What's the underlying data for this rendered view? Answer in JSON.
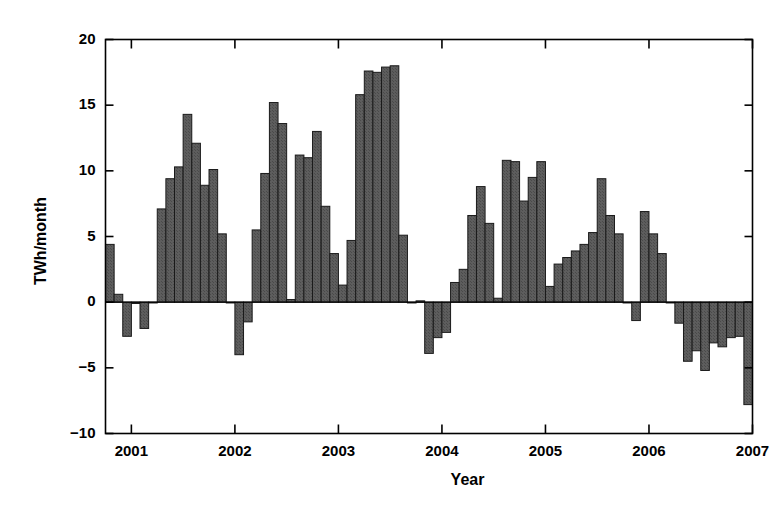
{
  "chart_data": {
    "type": "bar",
    "title": "",
    "xlabel": "Year",
    "ylabel": "TWh/month",
    "ylim": [
      -10,
      20
    ],
    "xlim": [
      2000.75,
      2007.0
    ],
    "yticks": [
      -10,
      -5,
      0,
      5,
      10,
      15,
      20
    ],
    "ytick_labels": [
      "−10",
      "−5",
      "0",
      "5",
      "10",
      "15",
      "20"
    ],
    "xticks": [
      2001,
      2002,
      2003,
      2004,
      2005,
      2006,
      2007
    ],
    "xtick_labels": [
      "2001",
      "2002",
      "2003",
      "2004",
      "2005",
      "2006",
      "2007"
    ],
    "grid": false,
    "legend": null,
    "bar_color": "#595959",
    "bar_edge_color": "#1a1a1a",
    "axes_color": "#000000",
    "background": "#ffffff",
    "bar_width_months": 1,
    "x_start": 2000.75,
    "categories": [
      "2000-10",
      "2000-11",
      "2000-12",
      "2001-01",
      "2001-02",
      "2001-03",
      "2001-04",
      "2001-05",
      "2001-06",
      "2001-07",
      "2001-08",
      "2001-09",
      "2001-10",
      "2001-11",
      "2001-12",
      "2002-01",
      "2002-02",
      "2002-03",
      "2002-04",
      "2002-05",
      "2002-06",
      "2002-07",
      "2002-08",
      "2002-09",
      "2002-10",
      "2002-11",
      "2002-12",
      "2003-01",
      "2003-02",
      "2003-03",
      "2003-04",
      "2003-05",
      "2003-06",
      "2003-07",
      "2003-08",
      "2003-09",
      "2003-10",
      "2003-11",
      "2003-12",
      "2004-01",
      "2004-02",
      "2004-03",
      "2004-04",
      "2004-05",
      "2004-06",
      "2004-07",
      "2004-08",
      "2004-09",
      "2004-10",
      "2004-11",
      "2004-12",
      "2005-01",
      "2005-02",
      "2005-03",
      "2005-04",
      "2005-05",
      "2005-06",
      "2005-07",
      "2005-08",
      "2005-09",
      "2005-10",
      "2005-11",
      "2005-12",
      "2006-01",
      "2006-02",
      "2006-03",
      "2006-04",
      "2006-05",
      "2006-06",
      "2006-07",
      "2006-08",
      "2006-09",
      "2006-10",
      "2006-11",
      "2006-12"
    ],
    "values": [
      4.4,
      0.6,
      -2.6,
      -0.1,
      -2.0,
      0.0,
      7.1,
      9.4,
      10.3,
      14.3,
      12.1,
      8.9,
      10.1,
      5.2,
      0.0,
      -4.0,
      -1.5,
      5.5,
      9.8,
      15.2,
      13.6,
      0.2,
      11.2,
      11.0,
      13.0,
      7.3,
      3.7,
      1.3,
      4.7,
      15.8,
      17.6,
      17.5,
      17.9,
      18.0,
      5.1,
      0.0,
      0.1,
      -3.9,
      -2.7,
      -2.3,
      1.5,
      2.5,
      6.6,
      8.8,
      6.0,
      0.3,
      10.8,
      10.7,
      7.7,
      9.5,
      10.7,
      1.2,
      2.9,
      3.4,
      3.9,
      4.4,
      5.3,
      9.4,
      6.6,
      5.2,
      0.0,
      -1.4,
      6.9,
      5.2,
      3.7,
      0.0,
      -1.6,
      -4.5,
      -3.7,
      -5.2,
      -3.1,
      -3.4,
      -2.7,
      -2.6,
      -7.8
    ]
  },
  "axis_titles": {
    "x": "Year",
    "y": "TWh/month"
  }
}
